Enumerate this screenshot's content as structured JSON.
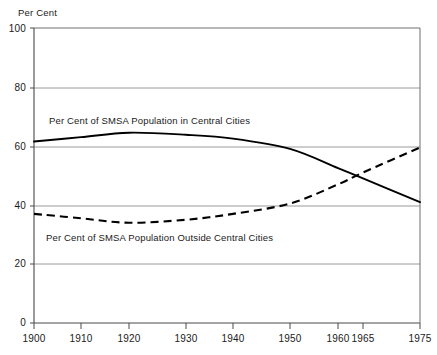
{
  "chart_data": {
    "type": "line",
    "title": "",
    "ylabel": "Per Cent",
    "xlabel": "",
    "ylim": [
      0,
      100
    ],
    "xlim": [
      1900,
      1975
    ],
    "grid": true,
    "grid_axis": "y",
    "legend_position": "inline-annotation",
    "yticks": [
      0,
      20,
      40,
      60,
      80,
      100
    ],
    "ytick_labels": [
      "0",
      "20",
      "40",
      "60",
      "80",
      "100"
    ],
    "xticks": [
      1900,
      1910,
      1920,
      1930,
      1940,
      1950,
      1960,
      1965,
      1975
    ],
    "xtick_labels": [
      "1900",
      "1910",
      "1920",
      "1930",
      "1940",
      "1950",
      "1960",
      "1965",
      "1975"
    ],
    "series": [
      {
        "name": "Per Cent of SMSA Population in Central Cities",
        "style": "solid",
        "color": "#000000",
        "x": [
          1900,
          1910,
          1920,
          1930,
          1940,
          1950,
          1960,
          1965,
          1975
        ],
        "values": [
          61.5,
          63.0,
          64.5,
          63.8,
          62.5,
          59.0,
          52.5,
          49.0,
          41.0
        ]
      },
      {
        "name": "Per Cent of SMSA Population Outside Central Cities",
        "style": "dashed",
        "color": "#000000",
        "x": [
          1900,
          1910,
          1920,
          1930,
          1940,
          1950,
          1960,
          1965,
          1975
        ],
        "values": [
          37.0,
          35.5,
          34.0,
          35.0,
          37.0,
          40.5,
          47.0,
          51.0,
          59.5
        ]
      }
    ],
    "annotations": [
      {
        "text": "Per Cent of SMSA Population in Central Cities",
        "x": 1905,
        "y": 70
      },
      {
        "text": "Per Cent of SMSA Population Outside Central Cities",
        "x": 1904,
        "y": 29
      }
    ]
  },
  "axis": {
    "y_title": "Per Cent"
  },
  "series_labels": {
    "central": "Per Cent of SMSA Population in Central Cities",
    "outside": "Per Cent of SMSA Population Outside Central Cities"
  },
  "yticks": [
    {
      "label": "100"
    },
    {
      "label": "80"
    },
    {
      "label": "60"
    },
    {
      "label": "40"
    },
    {
      "label": "20"
    },
    {
      "label": "0"
    }
  ],
  "xticks": [
    {
      "label": "1900"
    },
    {
      "label": "1910"
    },
    {
      "label": "1920"
    },
    {
      "label": "1930"
    },
    {
      "label": "1940"
    },
    {
      "label": "1950"
    },
    {
      "label": "1960"
    },
    {
      "label": "1965"
    },
    {
      "label": "1975"
    }
  ],
  "colors": {
    "line": "#000000",
    "grid": "#8a8a8a",
    "frame": "#6e6e6e",
    "text": "#1a1a1a"
  }
}
